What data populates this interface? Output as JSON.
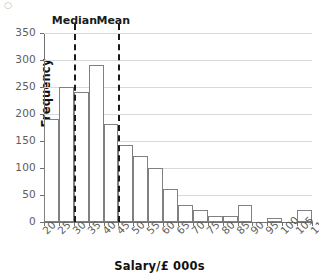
{
  "chart_data": {
    "type": "bar",
    "title": "",
    "subtitle": "",
    "xlabel": "Salary/£ 000s",
    "ylabel": "Frequency",
    "xlim": [
      20,
      110
    ],
    "ylim": [
      0,
      350
    ],
    "grid": true,
    "legend": null,
    "bin_width": 5,
    "x_tick_labels": [
      "20",
      "25",
      "30",
      "35",
      "40",
      "45",
      "50",
      "55",
      "60",
      "65",
      "70",
      "75",
      "80",
      "85",
      "90",
      "95",
      "100",
      "105",
      "110"
    ],
    "y_tick_labels": [
      "0",
      "50",
      "100",
      "150",
      "200",
      "250",
      "300",
      "350"
    ],
    "y_ticks": [
      0,
      50,
      100,
      150,
      200,
      250,
      300,
      350
    ],
    "categories": [
      "20-25",
      "25-30",
      "30-35",
      "35-40",
      "40-45",
      "45-50",
      "50-55",
      "55-60",
      "60-65",
      "65-70",
      "70-75",
      "75-80",
      "80-85",
      "85-90",
      "90-95",
      "95-100",
      "100-105",
      "105-110"
    ],
    "bin_starts": [
      20,
      25,
      30,
      35,
      40,
      45,
      50,
      55,
      60,
      65,
      70,
      75,
      80,
      85,
      90,
      95,
      100,
      105
    ],
    "values": [
      190,
      250,
      240,
      290,
      182,
      142,
      122,
      100,
      62,
      32,
      22,
      11,
      11,
      32,
      0,
      8,
      0,
      22
    ],
    "annotations": [
      {
        "name": "median",
        "label": "Median",
        "x": 30
      },
      {
        "name": "mean",
        "label": "Mean",
        "x": 45
      }
    ],
    "colors": {
      "bar_fill": "#ffffff",
      "bar_stroke": "#808080",
      "gridline": "#d9d9d9",
      "axis": "#6f6f6f",
      "annotation_line": "#1a1a1a",
      "text": "#111111",
      "tick_text": "#5c5c5c",
      "background": "#ffffff"
    }
  }
}
